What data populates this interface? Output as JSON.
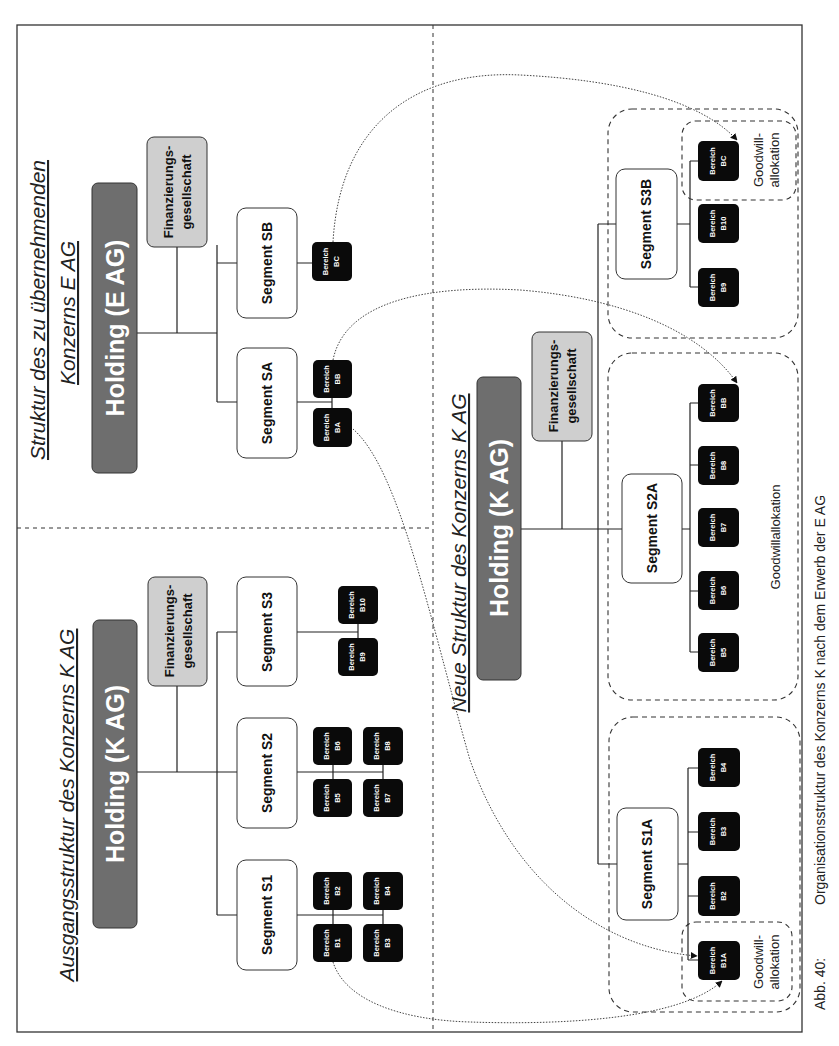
{
  "panels": {
    "target": {
      "title_line1": "Struktur des zu übernehmenden",
      "title_line2": "Konzerns E AG",
      "holding": "Holding (E AG)",
      "finance_line1": "Finanzierungs-",
      "finance_line2": "gesellschaft",
      "segments": [
        {
          "label": "Segment SA",
          "areas": [
            "BA",
            "BB"
          ]
        },
        {
          "label": "Segment SB",
          "areas": [
            "BC"
          ]
        }
      ]
    },
    "original": {
      "title": "Ausgangsstruktur des Konzerns K AG",
      "holding": "Holding (K AG)",
      "finance_line1": "Finanzierungs-",
      "finance_line2": "gesellschaft",
      "segments": [
        {
          "label": "Segment S1",
          "areas": [
            "B1",
            "B2",
            "B3",
            "B4"
          ]
        },
        {
          "label": "Segment S2",
          "areas": [
            "B5",
            "B6",
            "B7",
            "B8"
          ]
        },
        {
          "label": "Segment S3",
          "areas": [
            "B9",
            "B10"
          ]
        }
      ]
    },
    "new": {
      "title": "Neue Struktur des Konzerns K AG",
      "holding": "Holding (K AG)",
      "finance_line1": "Finanzierungs-",
      "finance_line2": "gesellschaft",
      "segments": [
        {
          "label": "Segment S1A",
          "areas": [
            "B1A",
            "B2",
            "B3",
            "B4"
          ],
          "goodwill_label_line1": "Goodwill-",
          "goodwill_label_line2": "allokation"
        },
        {
          "label": "Segment S2A",
          "areas": [
            "B5",
            "B6",
            "B7",
            "B8",
            "BB"
          ],
          "goodwill_label": "Goodwillallokation"
        },
        {
          "label": "Segment S3B",
          "areas": [
            "B9",
            "B10",
            "BC"
          ],
          "goodwill_label_line1": "Goodwill-",
          "goodwill_label_line2": "allokation"
        }
      ]
    }
  },
  "area_prefix": "Bereich",
  "arrows": [
    {
      "from": "BA",
      "to": "B1A"
    },
    {
      "from": "B1",
      "to": "B1A"
    },
    {
      "from": "BB",
      "to": "BB (S2A)"
    },
    {
      "from": "BC",
      "to": "BC (S3B)"
    }
  ],
  "caption": {
    "label": "Abb. 40:",
    "text": "Organisationsstruktur des Konzerns K nach dem Erwerb der E AG"
  },
  "colors": {
    "holding_fill": "#6e6e6e",
    "finance_fill": "#cfcfcf",
    "area_fill": "#0a0a0a",
    "segment_fill": "#ffffff"
  }
}
